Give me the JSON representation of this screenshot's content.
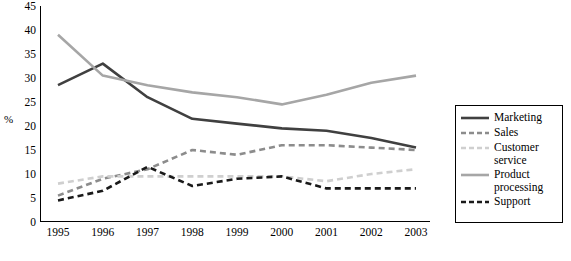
{
  "chart_data": {
    "type": "line",
    "title": "",
    "xlabel": "",
    "ylabel": "%",
    "categories": [
      "1995",
      "1996",
      "1997",
      "1998",
      "1999",
      "2000",
      "2001",
      "2002",
      "2003"
    ],
    "ylim": [
      0,
      45
    ],
    "yticks": [
      "0",
      "5",
      "10",
      "15",
      "20",
      "25",
      "30",
      "35",
      "40",
      "45"
    ],
    "grid": false,
    "legend_position": "right",
    "series": [
      {
        "name": "Marketing",
        "values": [
          28.5,
          33.0,
          26.0,
          21.5,
          20.5,
          19.5,
          19.0,
          17.5,
          15.5
        ],
        "color": "#404040",
        "style": "solid",
        "width": 2.6
      },
      {
        "name": "Sales",
        "values": [
          5.5,
          9.0,
          11.0,
          15.0,
          14.0,
          16.0,
          16.0,
          15.5,
          15.0
        ],
        "color": "#8c8c8c",
        "style": "dashed",
        "width": 2.6
      },
      {
        "name": "Customer service",
        "values": [
          8.0,
          9.5,
          9.5,
          9.5,
          9.5,
          9.5,
          8.5,
          10.0,
          11.0
        ],
        "color": "#cfcfcf",
        "style": "dashed",
        "width": 2.6
      },
      {
        "name": "Product processing",
        "values": [
          39.0,
          30.5,
          28.5,
          27.0,
          26.0,
          24.5,
          26.5,
          29.0,
          30.5
        ],
        "color": "#a6a6a6",
        "style": "solid",
        "width": 2.6
      },
      {
        "name": "Support",
        "values": [
          4.5,
          6.5,
          11.5,
          7.5,
          9.0,
          9.5,
          7.0,
          7.0,
          7.0
        ],
        "color": "#1a1a1a",
        "style": "dashed",
        "width": 2.6
      }
    ]
  },
  "legend": {
    "items": [
      {
        "label": "Marketing"
      },
      {
        "label": "Sales"
      },
      {
        "label": "Customer service"
      },
      {
        "label": "Product processing"
      },
      {
        "label": "Support"
      }
    ]
  }
}
